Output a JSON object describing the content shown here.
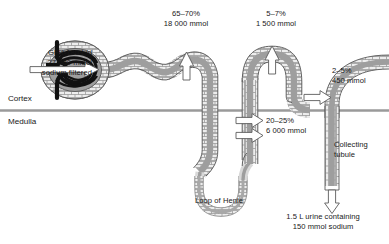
{
  "figure": {
    "type": "anatomical-flow-diagram",
    "zones": {
      "cortex": "Cortex",
      "medulla": "Medulla"
    },
    "structures": {
      "glomerulus": "glomerulus",
      "bowmans_capsule": "bowmans-capsule",
      "proximal_tubule": "proximal-convoluted-tubule",
      "loop_of_henle": "Loop of Henle",
      "distal_tubule": "distal-convoluted-tubule",
      "collecting_tubule": "Collecting\ntubule",
      "collecting_tubule_line1": "Collecting",
      "collecting_tubule_line2": "tubule"
    },
    "input": {
      "line1": "GFR 180 L/d",
      "line2": "27 000 mmol",
      "line3": "sodium filtered"
    },
    "reabsorption": [
      {
        "name": "proximal-tubule-reabsorption",
        "percent": "65–70%",
        "amount": "18 000 mmol",
        "arrow": "up"
      },
      {
        "name": "distal-tubule-reabsorption",
        "percent": "5–7%",
        "amount": "1 500 mmol",
        "arrow": "up"
      },
      {
        "name": "collecting-tubule-reabsorption",
        "percent": "2–5%",
        "amount": "450 mmol",
        "arrow": "right"
      },
      {
        "name": "loop-of-henle-reabsorption",
        "percent": "20–25%",
        "amount": "6 000 mmol",
        "arrow": "right"
      }
    ],
    "output": {
      "line1": "1.5 L urine containing",
      "line2": "150 mmol sodium",
      "arrow": "down"
    },
    "colors": {
      "lumen": "#9e9e9e",
      "epithelium": "#e8e8e8",
      "outline": "#4a4a4a",
      "glomerulus_capillary": "#1a1a1a",
      "boundary_line": "#9a9a9a",
      "arrow_fill": "#ffffff",
      "text": "#181818",
      "background": "#ffffff"
    }
  }
}
